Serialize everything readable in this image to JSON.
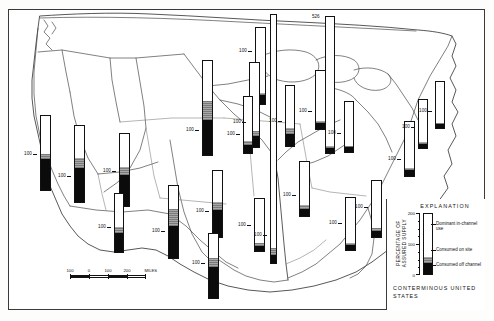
{
  "map": {
    "title": "Percentage of assured supply used, by water-resources region",
    "region_label": "CONTERMINOUS UNITED STATES",
    "frame_color": "#3a3a3a"
  },
  "scale": {
    "unit_label": "MILES",
    "ticks": [
      "100",
      "0",
      "100",
      "200"
    ],
    "end_label": "200 MILES"
  },
  "explanation": {
    "heading": "EXPLANATION",
    "axis_title": "PERCENTAGE OF ASSURED SUPPLY",
    "axis_ticks": [
      "200",
      "100",
      "0"
    ],
    "keys": [
      {
        "name": "dominant-in-channel-use",
        "label": "Dominant in-channel use",
        "color": "#ffffff"
      },
      {
        "name": "consumed-on-site",
        "label": "Consumed on site",
        "color": "#8e8e8e"
      },
      {
        "name": "consumed-off-channel",
        "label": "Consumed off channel",
        "color": "#0b0b0b"
      }
    ],
    "sample_bar": {
      "white_pct": 72,
      "gray_pct": 9,
      "black_pct": 19
    }
  },
  "chart_data": {
    "type": "bar",
    "ylabel": "PERCENTAGE OF ASSURED SUPPLY",
    "ylim": [
      0,
      230
    ],
    "grid": false,
    "legend": [
      "Dominant in-channel use",
      "Consumed on site",
      "Consumed off channel"
    ],
    "series": [
      {
        "name": "Dominant in-channel use",
        "color": "#ffffff"
      },
      {
        "name": "Consumed on site",
        "color": "#8e8e8e"
      },
      {
        "name": "Consumed off channel",
        "color": "#0b0b0b"
      }
    ],
    "bars": [
      {
        "name": "pacific-northwest",
        "tick": "100",
        "total": 165,
        "white": 140,
        "gray": 6,
        "black": 19,
        "x": 255,
        "y": 27,
        "w": 11,
        "h": 78,
        "tickY": 52,
        "tickSide": "left"
      },
      {
        "name": "california",
        "tick": "100",
        "total": 180,
        "white": 92,
        "gray": 12,
        "black": 76,
        "x": 40,
        "y": 115,
        "w": 11,
        "h": 76,
        "tickY": 155,
        "tickSide": "left"
      },
      {
        "name": "great-basin",
        "tick": "100",
        "total": 190,
        "white": 80,
        "gray": 24,
        "black": 86,
        "x": 74,
        "y": 125,
        "w": 11,
        "h": 78,
        "tickY": 177,
        "tickSide": "left"
      },
      {
        "name": "lower-colorado",
        "tick": "100",
        "total": 170,
        "white": 78,
        "gray": 18,
        "black": 74,
        "x": 119,
        "y": 133,
        "w": 11,
        "h": 74,
        "tickY": 172,
        "tickSide": "left"
      },
      {
        "name": "upper-colorado",
        "tick": "100",
        "total": 130,
        "white": 74,
        "gray": 14,
        "black": 42,
        "x": 114,
        "y": 193,
        "w": 10,
        "h": 60,
        "tickY": 228,
        "tickSide": "left"
      },
      {
        "name": "missouri",
        "tick": "100",
        "total": 205,
        "white": 88,
        "gray": 40,
        "black": 77,
        "x": 202,
        "y": 60,
        "w": 11,
        "h": 96,
        "tickY": 131,
        "tickSide": "left"
      },
      {
        "name": "rio-grande",
        "tick": "100",
        "total": 175,
        "white": 56,
        "gray": 40,
        "black": 79,
        "x": 168,
        "y": 185,
        "w": 11,
        "h": 74,
        "tickY": 232,
        "tickSide": "left"
      },
      {
        "name": "arkansas-white-red",
        "tick": "100",
        "total": 160,
        "white": 76,
        "gray": 18,
        "black": 66,
        "x": 212,
        "y": 170,
        "w": 11,
        "h": 68,
        "tickY": 212,
        "tickSide": "left"
      },
      {
        "name": "texas-gulf",
        "tick": "100",
        "total": 168,
        "white": 62,
        "gray": 24,
        "black": 82,
        "x": 208,
        "y": 233,
        "w": 11,
        "h": 66,
        "tickY": 264,
        "tickSide": "left"
      },
      {
        "name": "upper-mississippi",
        "tick": "100",
        "total": 180,
        "white": 146,
        "gray": 10,
        "black": 24,
        "x": 249,
        "y": 62,
        "w": 11,
        "h": 86,
        "tickY": 123,
        "tickSide": "left"
      },
      {
        "name": "souris-red-rainy",
        "tick": "100",
        "total": 120,
        "white": 94,
        "gray": 8,
        "black": 18,
        "x": 243,
        "y": 96,
        "w": 10,
        "h": 58,
        "tickY": 135,
        "tickSide": "left"
      },
      {
        "name": "great-lakes",
        "tick": "526",
        "total": 526,
        "white": 500,
        "gray": 6,
        "black": 20,
        "x": 325,
        "y": 16,
        "w": 10,
        "h": 138,
        "tickY": 14,
        "tickSide": "top"
      },
      {
        "name": "ohio",
        "tick": "100",
        "total": 120,
        "white": 103,
        "gray": 5,
        "black": 12,
        "x": 315,
        "y": 70,
        "w": 11,
        "h": 60,
        "tickY": 112,
        "tickSide": "left"
      },
      {
        "name": "tennessee",
        "tick": "100",
        "total": 110,
        "white": 96,
        "gray": 4,
        "black": 10,
        "x": 344,
        "y": 101,
        "w": 10,
        "h": 52,
        "tickY": 134,
        "tickSide": "left"
      },
      {
        "name": "lower-mississippi",
        "tick": "100",
        "total": 530,
        "white": 498,
        "gray": 14,
        "black": 18,
        "x": 270,
        "y": 14,
        "w": 7,
        "h": 250,
        "tickY": 236,
        "tickSide": "left"
      },
      {
        "name": "mid-atlantic",
        "tick": "100",
        "total": 118,
        "white": 100,
        "gray": 5,
        "black": 13,
        "x": 404,
        "y": 121,
        "w": 11,
        "h": 56,
        "tickY": 160,
        "tickSide": "left"
      },
      {
        "name": "new-england",
        "tick": "100",
        "total": 108,
        "white": 96,
        "gray": 3,
        "black": 9,
        "x": 435,
        "y": 81,
        "w": 10,
        "h": 48,
        "tickY": 112,
        "tickSide": "left"
      },
      {
        "name": "great-lakes-east",
        "tick": "100",
        "total": 112,
        "white": 98,
        "gray": 4,
        "black": 10,
        "x": 418,
        "y": 99,
        "w": 10,
        "h": 50,
        "tickY": 128,
        "tickSide": "left"
      },
      {
        "name": "south-atlantic-gulf",
        "tick": "100",
        "total": 124,
        "white": 104,
        "gray": 7,
        "black": 13,
        "x": 371,
        "y": 180,
        "w": 11,
        "h": 58,
        "tickY": 208,
        "tickSide": "left"
      },
      {
        "name": "southeast-coastal",
        "tick": "100",
        "total": 116,
        "white": 100,
        "gray": 5,
        "black": 11,
        "x": 345,
        "y": 197,
        "w": 11,
        "h": 54,
        "tickY": 224,
        "tickSide": "left"
      },
      {
        "name": "lower-missouri",
        "tick": "100",
        "total": 126,
        "white": 88,
        "gray": 12,
        "black": 26,
        "x": 285,
        "y": 85,
        "w": 10,
        "h": 62,
        "tickY": 122,
        "tickSide": "left"
      },
      {
        "name": "central-plains",
        "tick": "100",
        "total": 122,
        "white": 98,
        "gray": 8,
        "black": 16,
        "x": 299,
        "y": 161,
        "w": 11,
        "h": 56,
        "tickY": 196,
        "tickSide": "left"
      },
      {
        "name": "ozark",
        "tick": "100",
        "total": 114,
        "white": 96,
        "gray": 6,
        "black": 12,
        "x": 254,
        "y": 198,
        "w": 11,
        "h": 54,
        "tickY": 226,
        "tickSide": "left"
      }
    ]
  }
}
